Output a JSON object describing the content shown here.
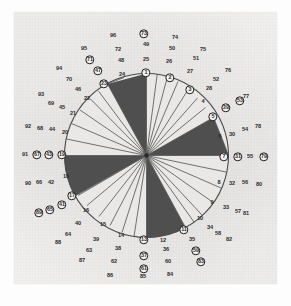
{
  "figure": {
    "type": "rose-diagram",
    "title": "",
    "center": {
      "x": 146.5,
      "y": 155.5
    },
    "radius": 82,
    "background_color": "#f2f1ef",
    "wedge_dark_color": "#4a4a4a",
    "wedge_light_color": "#e9e8e6",
    "outline_color": "#4a4a4a"
  },
  "chart_data": {
    "type": "pie",
    "title": "",
    "xlabel": "",
    "ylabel": "",
    "categories": [
      "1",
      "2",
      "3",
      "4",
      "5",
      "6",
      "7",
      "8",
      "9",
      "10",
      "11",
      "12"
    ],
    "values": [
      1,
      1,
      1,
      1,
      1,
      1,
      1,
      1,
      1,
      1,
      1,
      1
    ],
    "sectors": [
      {
        "index": 1,
        "start_deg": -15,
        "end_deg": 0,
        "fill": "dark"
      },
      {
        "index": 2,
        "start_deg": 0,
        "end_deg": 30,
        "fill": "light"
      },
      {
        "index": 3,
        "start_deg": 30,
        "end_deg": 60,
        "fill": "light"
      },
      {
        "index": 4,
        "start_deg": 60,
        "end_deg": 90,
        "fill": "dark"
      },
      {
        "index": 5,
        "start_deg": 90,
        "end_deg": 105,
        "fill": "light"
      },
      {
        "index": 6,
        "start_deg": 105,
        "end_deg": 180,
        "fill": "light"
      },
      {
        "index": 7,
        "start_deg": 180,
        "end_deg": 195,
        "fill": "dark"
      },
      {
        "index": 8,
        "start_deg": 195,
        "end_deg": 270,
        "fill": "light"
      },
      {
        "index": 9,
        "start_deg": 270,
        "end_deg": 285,
        "fill": "dark"
      },
      {
        "index": 10,
        "start_deg": 285,
        "end_deg": 345,
        "fill": "light"
      }
    ],
    "legend_position": "none",
    "grid": false
  },
  "labels": {
    "ring1": [
      "1",
      "2",
      "3",
      "4",
      "5",
      "6",
      "7",
      "8",
      "9",
      "10",
      "11",
      "12",
      "13",
      "14",
      "15",
      "16",
      "17",
      "18",
      "19",
      "20",
      "21",
      "22",
      "23",
      "24"
    ],
    "ring2": [
      "25",
      "26",
      "27",
      "28",
      "29",
      "30",
      "31",
      "32",
      "33",
      "34",
      "35",
      "36",
      "37",
      "38",
      "39",
      "40",
      "41",
      "42",
      "43",
      "44",
      "45",
      "46",
      "47",
      "48"
    ],
    "ring3": [
      "49",
      "50",
      "51",
      "52",
      "53",
      "54",
      "55",
      "56",
      "57",
      "58",
      "59",
      "60",
      "61",
      "62",
      "63",
      "64",
      "65",
      "66",
      "67",
      "68",
      "69",
      "70",
      "71",
      "72"
    ],
    "ring4": [
      "73",
      "74",
      "75",
      "76",
      "77",
      "78",
      "79",
      "80",
      "81",
      "82",
      "83",
      "84",
      "85",
      "86",
      "87",
      "88",
      "89",
      "90",
      "91",
      "92",
      "93",
      "94",
      "95",
      "96"
    ],
    "circled": [
      "1",
      "2",
      "3",
      "5",
      "7",
      "11",
      "13",
      "17",
      "19",
      "23",
      "29",
      "31",
      "37",
      "41",
      "43",
      "47",
      "53",
      "59",
      "61",
      "67",
      "71",
      "73",
      "79",
      "83",
      "89"
    ],
    "all": [
      {
        "t": "1",
        "x": 146,
        "y": 73,
        "c": true
      },
      {
        "t": "2",
        "x": 170,
        "y": 78,
        "c": true
      },
      {
        "t": "3",
        "x": 190,
        "y": 90,
        "c": true
      },
      {
        "t": "4",
        "x": 203,
        "y": 102,
        "c": false
      },
      {
        "t": "5",
        "x": 213,
        "y": 117,
        "c": true
      },
      {
        "t": "6",
        "x": 220,
        "y": 137,
        "c": false
      },
      {
        "t": "7",
        "x": 224,
        "y": 157,
        "c": true
      },
      {
        "t": "8",
        "x": 219,
        "y": 183,
        "c": false
      },
      {
        "t": "9",
        "x": 212,
        "y": 203,
        "c": false
      },
      {
        "t": "10",
        "x": 200,
        "y": 219,
        "c": false
      },
      {
        "t": "11",
        "x": 184,
        "y": 230,
        "c": true
      },
      {
        "t": "12",
        "x": 163,
        "y": 241,
        "c": false
      },
      {
        "t": "13",
        "x": 144,
        "y": 240,
        "c": true
      },
      {
        "t": "14",
        "x": 121,
        "y": 236,
        "c": false
      },
      {
        "t": "15",
        "x": 103,
        "y": 225,
        "c": false
      },
      {
        "t": "16",
        "x": 86,
        "y": 211,
        "c": false
      },
      {
        "t": "17",
        "x": 72,
        "y": 196,
        "c": true
      },
      {
        "t": "18",
        "x": 66,
        "y": 177,
        "c": false
      },
      {
        "t": "19",
        "x": 62,
        "y": 155,
        "c": true
      },
      {
        "t": "20",
        "x": 65,
        "y": 133,
        "c": false
      },
      {
        "t": "21",
        "x": 73,
        "y": 114,
        "c": false
      },
      {
        "t": "22",
        "x": 87,
        "y": 99,
        "c": false
      },
      {
        "t": "23",
        "x": 104,
        "y": 84,
        "c": true
      },
      {
        "t": "24",
        "x": 122,
        "y": 75,
        "c": false
      },
      {
        "t": "25",
        "x": 146,
        "y": 60,
        "c": false
      },
      {
        "t": "26",
        "x": 169,
        "y": 62,
        "c": false
      },
      {
        "t": "27",
        "x": 190,
        "y": 72,
        "c": false
      },
      {
        "t": "28",
        "x": 209,
        "y": 89,
        "c": false
      },
      {
        "t": "29",
        "x": 226,
        "y": 108,
        "c": true
      },
      {
        "t": "30",
        "x": 232,
        "y": 135,
        "c": false
      },
      {
        "t": "31",
        "x": 238,
        "y": 157,
        "c": true
      },
      {
        "t": "32",
        "x": 232,
        "y": 184,
        "c": false
      },
      {
        "t": "33",
        "x": 226,
        "y": 208,
        "c": false
      },
      {
        "t": "34",
        "x": 210,
        "y": 228,
        "c": false
      },
      {
        "t": "35",
        "x": 192,
        "y": 240,
        "c": false
      },
      {
        "t": "36",
        "x": 166,
        "y": 250,
        "c": false
      },
      {
        "t": "37",
        "x": 144,
        "y": 256,
        "c": true
      },
      {
        "t": "38",
        "x": 118,
        "y": 249,
        "c": false
      },
      {
        "t": "39",
        "x": 96,
        "y": 240,
        "c": false
      },
      {
        "t": "40",
        "x": 78,
        "y": 224,
        "c": false
      },
      {
        "t": "41",
        "x": 62,
        "y": 205,
        "c": true
      },
      {
        "t": "42",
        "x": 51,
        "y": 183,
        "c": false
      },
      {
        "t": "43",
        "x": 49,
        "y": 155,
        "c": true
      },
      {
        "t": "44",
        "x": 52,
        "y": 130,
        "c": false
      },
      {
        "t": "45",
        "x": 62,
        "y": 108,
        "c": false
      },
      {
        "t": "46",
        "x": 78,
        "y": 90,
        "c": false
      },
      {
        "t": "47",
        "x": 98,
        "y": 71,
        "c": true
      },
      {
        "t": "48",
        "x": 121,
        "y": 61,
        "c": false
      },
      {
        "t": "49",
        "x": 146,
        "y": 45,
        "c": false
      },
      {
        "t": "50",
        "x": 172,
        "y": 49,
        "c": false
      },
      {
        "t": "51",
        "x": 196,
        "y": 59,
        "c": false
      },
      {
        "t": "52",
        "x": 216,
        "y": 80,
        "c": false
      },
      {
        "t": "53",
        "x": 240,
        "y": 101,
        "c": true
      },
      {
        "t": "54",
        "x": 245,
        "y": 130,
        "c": false
      },
      {
        "t": "55",
        "x": 250,
        "y": 157,
        "c": false
      },
      {
        "t": "56",
        "x": 245,
        "y": 183,
        "c": false
      },
      {
        "t": "57",
        "x": 238,
        "y": 212,
        "c": false
      },
      {
        "t": "58",
        "x": 218,
        "y": 234,
        "c": false
      },
      {
        "t": "59",
        "x": 196,
        "y": 251,
        "c": true
      },
      {
        "t": "60",
        "x": 168,
        "y": 262,
        "c": false
      },
      {
        "t": "61",
        "x": 144,
        "y": 269,
        "c": true
      },
      {
        "t": "62",
        "x": 114,
        "y": 262,
        "c": false
      },
      {
        "t": "63",
        "x": 89,
        "y": 251,
        "c": false
      },
      {
        "t": "64",
        "x": 68,
        "y": 235,
        "c": false
      },
      {
        "t": "65",
        "x": 50,
        "y": 210,
        "c": true
      },
      {
        "t": "66",
        "x": 39,
        "y": 183,
        "c": false
      },
      {
        "t": "67",
        "x": 37,
        "y": 155,
        "c": true
      },
      {
        "t": "68",
        "x": 40,
        "y": 129,
        "c": false
      },
      {
        "t": "69",
        "x": 51,
        "y": 104,
        "c": false
      },
      {
        "t": "70",
        "x": 69,
        "y": 80,
        "c": false
      },
      {
        "t": "71",
        "x": 90,
        "y": 60,
        "c": true
      },
      {
        "t": "72",
        "x": 118,
        "y": 50,
        "c": false
      },
      {
        "t": "73",
        "x": 144,
        "y": 34,
        "c": true
      },
      {
        "t": "74",
        "x": 175,
        "y": 38,
        "c": false
      },
      {
        "t": "75",
        "x": 203,
        "y": 50,
        "c": false
      },
      {
        "t": "76",
        "x": 228,
        "y": 71,
        "c": false
      },
      {
        "t": "77",
        "x": 246,
        "y": 97,
        "c": false
      },
      {
        "t": "78",
        "x": 258,
        "y": 127,
        "c": false
      },
      {
        "t": "79",
        "x": 264,
        "y": 157,
        "c": true
      },
      {
        "t": "80",
        "x": 259,
        "y": 185,
        "c": false
      },
      {
        "t": "81",
        "x": 246,
        "y": 214,
        "c": false
      },
      {
        "t": "82",
        "x": 229,
        "y": 240,
        "c": false
      },
      {
        "t": "83",
        "x": 201,
        "y": 262,
        "c": true
      },
      {
        "t": "84",
        "x": 170,
        "y": 275,
        "c": false
      },
      {
        "t": "85",
        "x": 143,
        "y": 277,
        "c": false
      },
      {
        "t": "86",
        "x": 110,
        "y": 276,
        "c": false
      },
      {
        "t": "87",
        "x": 82,
        "y": 261,
        "c": false
      },
      {
        "t": "88",
        "x": 58,
        "y": 243,
        "c": false
      },
      {
        "t": "89",
        "x": 39,
        "y": 213,
        "c": true
      },
      {
        "t": "90",
        "x": 28,
        "y": 184,
        "c": false
      },
      {
        "t": "91",
        "x": 25,
        "y": 155,
        "c": false
      },
      {
        "t": "92",
        "x": 28,
        "y": 127,
        "c": false
      },
      {
        "t": "93",
        "x": 41,
        "y": 95,
        "c": false
      },
      {
        "t": "94",
        "x": 59,
        "y": 69,
        "c": false
      },
      {
        "t": "95",
        "x": 84,
        "y": 49,
        "c": false
      },
      {
        "t": "96",
        "x": 113,
        "y": 36,
        "c": false
      }
    ]
  }
}
